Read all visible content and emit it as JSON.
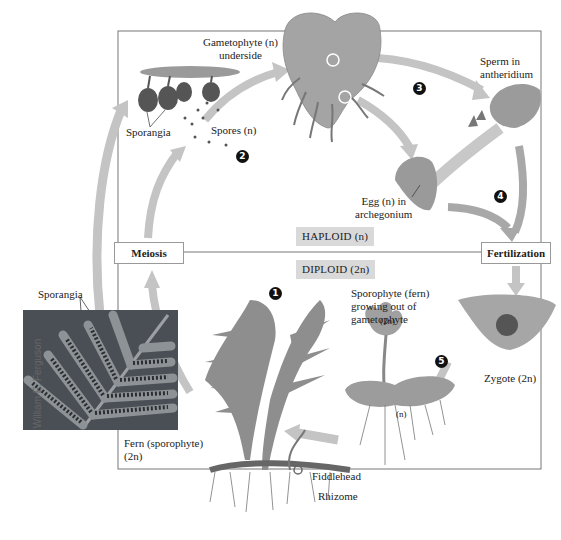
{
  "regions": {
    "haploid": "HAPLOID (n)",
    "diploid": "DIPLOID (2n)"
  },
  "stages": {
    "meiosis": "Meiosis",
    "fertilization": "Fertilization"
  },
  "steps": [
    "1",
    "2",
    "3",
    "4",
    "5"
  ],
  "labels": {
    "gametophyte_underside": [
      "Gametophyte (n)",
      "underside"
    ],
    "sporangia_top": "Sporangia",
    "spores": "Spores (n)",
    "sperm": [
      "Sperm in",
      "antheridium"
    ],
    "egg": [
      "Egg (n) in",
      "archegonium"
    ],
    "sporangia_photo": "Sporangia",
    "fern_sporophyte": [
      "Fern (sporophyte)",
      "(2n)"
    ],
    "fiddlehead": "Fiddlehead",
    "rhizome": "Rhizome",
    "young_sporophyte": [
      "Sporophyte (fern)",
      "growing out of",
      "gametophyte"
    ],
    "young_sporophyte_ploidy": "(2n)",
    "gametophyte_ploidy": "(n)",
    "zygote": "Zygote (2n)"
  },
  "photo_credit": "William E. Ferguson",
  "colors": {
    "arrow": "#bdbdbd",
    "ploidy_bg": "#d9d9d9",
    "frame": "#777777",
    "photo_bg": "#4a4f55",
    "plant": "#8e8e8e"
  }
}
